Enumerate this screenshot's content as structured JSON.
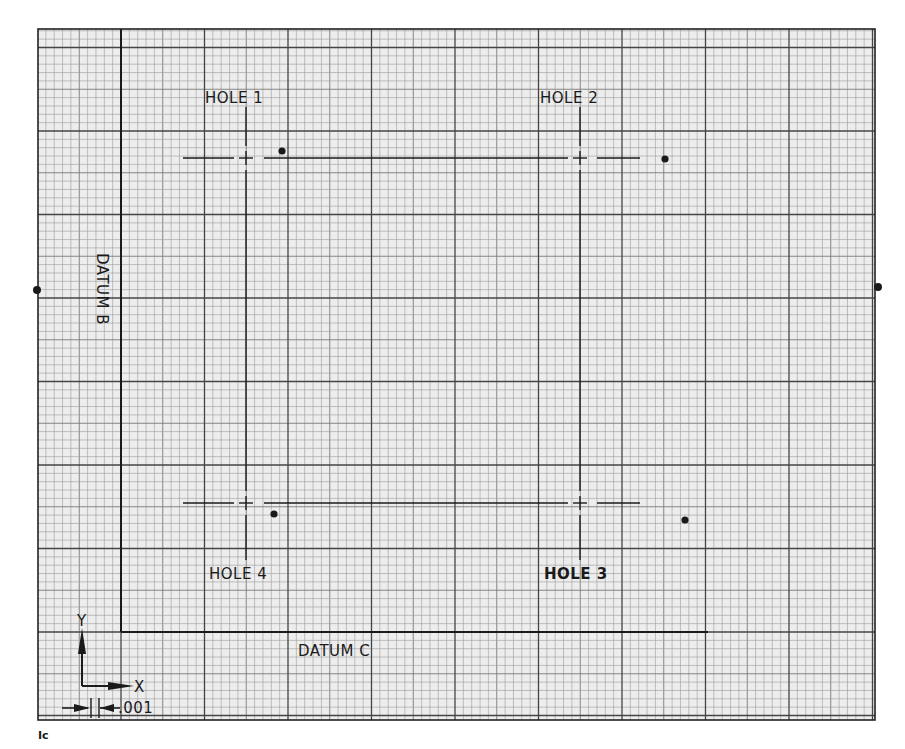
{
  "figure": {
    "label": "Ic",
    "background": "#ededed",
    "grid": {
      "left": 38,
      "top": 29,
      "right": 875,
      "bottom": 720,
      "minor_step": 8.35,
      "major_every": 10,
      "minor_color": "#9a9a9a",
      "major_color": "#444444",
      "border_color": "#222222"
    }
  },
  "datums": {
    "b": {
      "label": "DATUM B",
      "x": 121,
      "y1": 29,
      "y2": 632
    },
    "c": {
      "label": "DATUM C",
      "y": 632,
      "x1": 121,
      "x2": 708
    }
  },
  "holes": [
    {
      "label": "HOLE 1",
      "cx": 246,
      "cy": 158,
      "label_x": 205,
      "label_y": 103,
      "actual": {
        "x": 282,
        "y": 151
      }
    },
    {
      "label": "HOLE 2",
      "cx": 580,
      "cy": 158,
      "label_x": 540,
      "label_y": 103,
      "actual": {
        "x": 665,
        "y": 159
      }
    },
    {
      "label": "HOLE 3",
      "cx": 580,
      "cy": 503,
      "label_x": 544,
      "label_y": 579,
      "actual": {
        "x": 685,
        "y": 520
      }
    },
    {
      "label": "HOLE 4",
      "cx": 246,
      "cy": 503,
      "label_x": 209,
      "label_y": 579,
      "actual": {
        "x": 274,
        "y": 514
      }
    }
  ],
  "edge_markers": [
    {
      "x": 37,
      "y": 290
    },
    {
      "x": 878,
      "y": 287
    }
  ],
  "axes_legend": {
    "y_label": "Y",
    "x_label": "X",
    "scale_label": ".001"
  },
  "ink_color": "#1a1a1a"
}
